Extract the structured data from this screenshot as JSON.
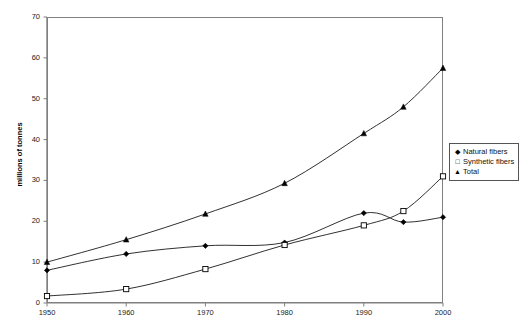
{
  "chart_data": {
    "type": "line",
    "title": "",
    "xlabel": "",
    "ylabel": "millions of tonnes",
    "x": [
      1950,
      1960,
      1970,
      1980,
      1990,
      1995,
      2000
    ],
    "xlim": [
      1950,
      2000
    ],
    "ylim": [
      0,
      70
    ],
    "xticks": [
      "1950",
      "1960",
      "1970",
      "1980",
      "1990",
      "2000"
    ],
    "xtick_values": [
      1950,
      1960,
      1970,
      1980,
      1990,
      2000
    ],
    "yticks": [
      "0",
      "10",
      "20",
      "30",
      "40",
      "50",
      "60",
      "70"
    ],
    "ytick_values": [
      0,
      10,
      20,
      30,
      40,
      50,
      60,
      70
    ],
    "grid": false,
    "legend_position": "right",
    "series": [
      {
        "name": "Natural fibers",
        "marker": "filled-diamond",
        "color": "#000000",
        "values": [
          8,
          12,
          14,
          14.8,
          22,
          19.8,
          21
        ]
      },
      {
        "name": "Synthetic fibers",
        "marker": "open-square",
        "color": "#000000",
        "values": [
          1.7,
          3.4,
          8.3,
          14.2,
          19,
          22.5,
          31
        ]
      },
      {
        "name": "Total",
        "marker": "filled-triangle",
        "color": "#000000",
        "values": [
          10,
          15.5,
          21.8,
          29.3,
          41.5,
          48,
          57.5
        ]
      }
    ]
  },
  "legend": {
    "items": [
      {
        "label": "Natural fibers",
        "glyph": "◆"
      },
      {
        "label": "Synthetic fibers",
        "glyph": "□"
      },
      {
        "label": "Total",
        "glyph": "▲"
      }
    ]
  },
  "colors": {
    "frame": "#808080",
    "line": "#1a1a1a",
    "marker": "#000000",
    "background": "#ffffff"
  }
}
